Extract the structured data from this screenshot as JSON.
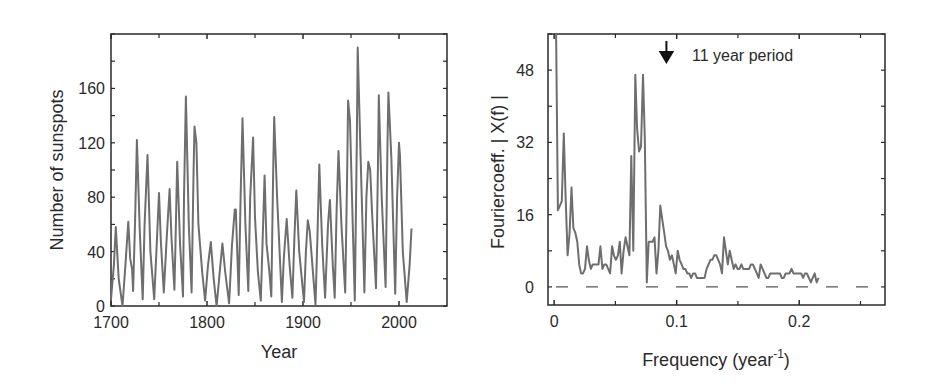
{
  "chart_data": [
    {
      "id": "sunspots",
      "type": "line",
      "title": "",
      "xlabel": "Year",
      "ylabel": "Number of sunspots",
      "xlim": [
        1700,
        2050
      ],
      "ylim": [
        0,
        200
      ],
      "xticks": [
        1700,
        1800,
        1900,
        2000
      ],
      "xtick_labels": [
        "1700",
        "1800",
        "1900",
        "2000"
      ],
      "yticks": [
        0,
        40,
        80,
        120,
        160
      ],
      "ytick_labels": [
        "0",
        "40",
        "80",
        "120",
        "160"
      ],
      "grid": false,
      "legend": null,
      "line_color": "#6e6e6e",
      "series": [
        {
          "name": "Yearly mean sunspot number",
          "x": [
            1700,
            1703,
            1705,
            1708,
            1712,
            1715,
            1718,
            1720,
            1722,
            1723,
            1725,
            1727,
            1730,
            1733,
            1735,
            1738,
            1741,
            1745,
            1747,
            1750,
            1752,
            1755,
            1758,
            1761,
            1763,
            1766,
            1767,
            1769,
            1772,
            1775,
            1776,
            1778,
            1781,
            1784,
            1786,
            1787,
            1789,
            1791,
            1795,
            1798,
            1801,
            1804,
            1807,
            1810,
            1812,
            1816,
            1819,
            1823,
            1826,
            1829,
            1830,
            1833,
            1835,
            1837,
            1840,
            1843,
            1845,
            1848,
            1850,
            1853,
            1856,
            1858,
            1860,
            1862,
            1865,
            1867,
            1869,
            1870,
            1873,
            1878,
            1880,
            1883,
            1886,
            1889,
            1891,
            1893,
            1896,
            1901,
            1903,
            1905,
            1907,
            1913,
            1915,
            1917,
            1920,
            1923,
            1926,
            1928,
            1931,
            1933,
            1935,
            1937,
            1940,
            1944,
            1946,
            1947,
            1949,
            1951,
            1954,
            1956,
            1957,
            1960,
            1964,
            1966,
            1968,
            1970,
            1972,
            1976,
            1978,
            1979,
            1982,
            1986,
            1988,
            1989,
            1992,
            1996,
            1998,
            2000,
            2001,
            2004,
            2008,
            2011,
            2013
          ],
          "y": [
            5,
            30,
            58,
            20,
            0,
            30,
            62,
            35,
            27,
            11,
            60,
            122,
            55,
            5,
            60,
            111,
            40,
            5,
            35,
            83,
            47,
            10,
            50,
            86,
            50,
            12,
            40,
            106,
            45,
            7,
            80,
            154,
            60,
            10,
            100,
            132,
            120,
            60,
            25,
            4,
            30,
            47,
            20,
            0,
            15,
            46,
            25,
            2,
            45,
            71,
            71,
            8,
            80,
            138,
            60,
            11,
            80,
            124,
            65,
            25,
            4,
            50,
            96,
            46,
            25,
            7,
            100,
            139,
            80,
            3,
            35,
            64,
            30,
            6,
            50,
            85,
            40,
            3,
            40,
            63,
            55,
            1,
            50,
            104,
            45,
            6,
            60,
            78,
            30,
            6,
            70,
            114,
            60,
            10,
            100,
            151,
            136,
            80,
            4,
            120,
            190,
            110,
            10,
            80,
            106,
            100,
            68,
            13,
            100,
            155,
            80,
            14,
            120,
            157,
            110,
            9,
            80,
            120,
            110,
            40,
            3,
            30,
            57
          ]
        }
      ]
    },
    {
      "id": "fourier-spectrum",
      "type": "line",
      "title": "",
      "xlabel": "Frequency (year^-1)",
      "ylabel": "Fouriercoeff. | X(f) |",
      "xlim": [
        -0.005,
        0.27
      ],
      "ylim": [
        -4,
        56
      ],
      "xticks": [
        0,
        0.1,
        0.2
      ],
      "xtick_labels": [
        "0",
        "0.1",
        "0.2"
      ],
      "yticks": [
        0,
        16,
        32,
        48
      ],
      "ytick_labels": [
        "0",
        "16",
        "32",
        "48"
      ],
      "grid": false,
      "legend": null,
      "line_color": "#6e6e6e",
      "reference_line": {
        "y": 0,
        "style": "dashed",
        "color": "#555555"
      },
      "annotations": [
        {
          "text": "11 year period",
          "x": 0.09,
          "y": 48,
          "arrow": "down",
          "arrow_color": "#111111"
        }
      ],
      "series": [
        {
          "name": "|X(f)|",
          "x": [
            0.0016,
            0.0031,
            0.0047,
            0.0063,
            0.0079,
            0.0094,
            0.011,
            0.0126,
            0.0142,
            0.0157,
            0.0173,
            0.0189,
            0.0205,
            0.022,
            0.0236,
            0.0252,
            0.0268,
            0.0283,
            0.0299,
            0.0315,
            0.0331,
            0.0346,
            0.0362,
            0.0378,
            0.0394,
            0.041,
            0.0425,
            0.0441,
            0.0457,
            0.0473,
            0.0488,
            0.0504,
            0.052,
            0.0536,
            0.0551,
            0.0567,
            0.0583,
            0.0599,
            0.0614,
            0.063,
            0.0646,
            0.0662,
            0.0677,
            0.0693,
            0.0709,
            0.0725,
            0.074,
            0.0756,
            0.0772,
            0.0788,
            0.0803,
            0.0819,
            0.0835,
            0.0851,
            0.0866,
            0.0882,
            0.0898,
            0.0914,
            0.0929,
            0.0945,
            0.0961,
            0.0977,
            0.0992,
            0.1008,
            0.1024,
            0.104,
            0.1055,
            0.1071,
            0.1087,
            0.1102,
            0.1118,
            0.1134,
            0.115,
            0.1165,
            0.1181,
            0.1197,
            0.1213,
            0.1228,
            0.1244,
            0.126,
            0.1276,
            0.1291,
            0.1307,
            0.1323,
            0.1339,
            0.1354,
            0.137,
            0.1386,
            0.1402,
            0.1417,
            0.1433,
            0.1449,
            0.1465,
            0.148,
            0.1496,
            0.1512,
            0.1528,
            0.1543,
            0.1559,
            0.1575,
            0.1591,
            0.1606,
            0.1622,
            0.1638,
            0.1654,
            0.1669,
            0.1685,
            0.1701,
            0.1717,
            0.1732,
            0.1748,
            0.1764,
            0.178,
            0.1795,
            0.1811,
            0.1827,
            0.1843,
            0.1858,
            0.1874,
            0.189,
            0.1906,
            0.1921,
            0.1937,
            0.1953,
            0.1969,
            0.1984,
            0.2,
            0.2016,
            0.2032,
            0.2047,
            0.2063,
            0.2079,
            0.2095,
            0.211,
            0.2126,
            0.2142,
            0.2158,
            0.2173,
            0.2189,
            0.2205,
            0.2221,
            0.2236,
            0.2252,
            0.2268,
            0.2284,
            0.2299,
            0.2315,
            0.2331,
            0.2347,
            0.2362,
            0.2378,
            0.2394,
            0.241,
            0.2425,
            0.2441,
            0.2457,
            0.2473,
            0.2488,
            0.2504,
            0.252,
            0.2536,
            0.2551,
            0.2567,
            0.2583,
            0.2599,
            0.2614,
            0.263,
            0.2646,
            0.2662
          ],
          "y": [
            56,
            17,
            18,
            19,
            34,
            20,
            7,
            12,
            22,
            13,
            12,
            10,
            5,
            3,
            3,
            4,
            9,
            6,
            4,
            5,
            5,
            5,
            5,
            9,
            4,
            5,
            5,
            4,
            3,
            9,
            7,
            6,
            7,
            10,
            3,
            8,
            11,
            9,
            7,
            29,
            8,
            47,
            35,
            30,
            31,
            47,
            33,
            1,
            10,
            10,
            10,
            11,
            3,
            8,
            18,
            15,
            12,
            9,
            8,
            6,
            7,
            5,
            3,
            8,
            6,
            5,
            4,
            4,
            3,
            3,
            2,
            3,
            3,
            2,
            2,
            2,
            2,
            2,
            4,
            5,
            6,
            6,
            7,
            7,
            6,
            5,
            3,
            11,
            8,
            5,
            8,
            6,
            4,
            5,
            4,
            4,
            5,
            4,
            4,
            4,
            4,
            5,
            5,
            4,
            3,
            2,
            5,
            4,
            3,
            2,
            2,
            3,
            3,
            3,
            3,
            3,
            3,
            2,
            2,
            3,
            3,
            3,
            4,
            3,
            3,
            3,
            3,
            3,
            2,
            3,
            3,
            2,
            1,
            2,
            3,
            1,
            2
          ]
        }
      ]
    }
  ]
}
